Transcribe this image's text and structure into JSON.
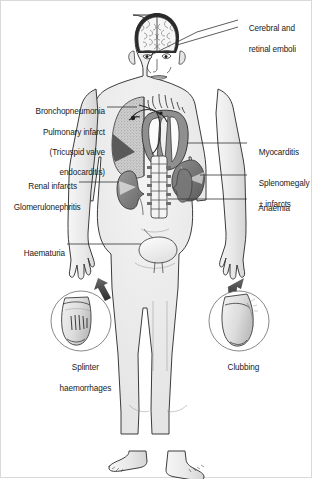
{
  "figure": {
    "background_color": "#ffffff",
    "border_color": "#d9d9d9",
    "body_fill": "#ececec",
    "body_outline": "#3c3c3c",
    "organ_dark": "#6e6e6e",
    "organ_mid": "#b4b4b4",
    "organ_light": "#dcdcdc",
    "leader_color": "#333333",
    "text_color": "#1a1a1a"
  },
  "labels": {
    "cerebral": {
      "name": "cerebral-and-retinal-emboli",
      "lines": [
        "Cerebral and",
        "retinal emboli"
      ],
      "side": "right"
    },
    "bronchopneumonia": {
      "name": "bronchopneumonia-pulmonary-infarct",
      "lines": [
        "Bronchopneumonia",
        "Pulmonary infarct",
        "(Tricuspid valve",
        "endocarditis)"
      ],
      "side": "left"
    },
    "myocarditis": {
      "name": "myocarditis",
      "lines": [
        "Myocarditis"
      ],
      "side": "right"
    },
    "splenomegaly": {
      "name": "splenomegaly-plus-minus-infarcts",
      "lines": [
        "Splenomegaly",
        "± infarcts"
      ],
      "side": "right"
    },
    "anaemia": {
      "name": "anaemia",
      "lines": [
        "Anaemia"
      ],
      "side": "right"
    },
    "renal": {
      "name": "renal-infarcts-glomerulonephritis",
      "lines": [
        "Renal infarcts",
        "Glomerulonephritis"
      ],
      "side": "left"
    },
    "haematuria": {
      "name": "haematuria",
      "lines": [
        "Haematuria"
      ],
      "side": "left"
    },
    "splinter": {
      "name": "splinter-haemorrhages",
      "lines": [
        "Splinter",
        "haemorrhages"
      ],
      "side": "below"
    },
    "clubbing": {
      "name": "clubbing",
      "lines": [
        "Clubbing"
      ],
      "side": "below"
    }
  },
  "anatomy": {
    "organs": [
      "brain",
      "skull",
      "left-lung",
      "heart",
      "spleen",
      "left-kidney",
      "right-kidney",
      "vertebral-column",
      "bladder"
    ],
    "insets": [
      {
        "name": "fingernail-splinter-haemorrhages",
        "shape": "circle"
      },
      {
        "name": "fingernail-clubbing",
        "shape": "circle"
      }
    ]
  }
}
